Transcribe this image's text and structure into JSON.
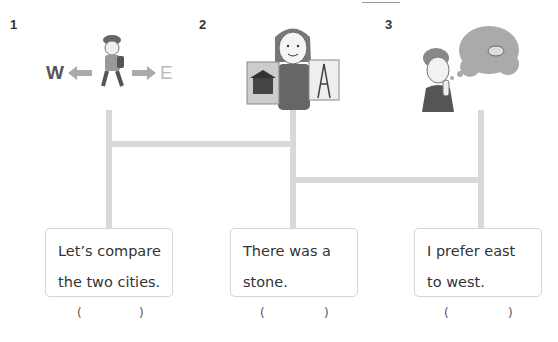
{
  "items": [
    {
      "number": "1",
      "illustration": "boy-walking-west-east-icon",
      "labels": {
        "west": "W",
        "east": "E"
      },
      "sentence_line1": "Let’s compare",
      "sentence_line2": "the two cities.",
      "answer_open": "(",
      "answer_close": ")"
    },
    {
      "number": "2",
      "illustration": "woman-holding-city-pictures-icon",
      "sentence_line1": "There was a",
      "sentence_line2": "stone.",
      "answer_open": "(",
      "answer_close": ")"
    },
    {
      "number": "3",
      "illustration": "boy-thinking-of-stone-icon",
      "sentence_line1": "I prefer east",
      "sentence_line2": "to west.",
      "answer_open": "(",
      "answer_close": ")"
    }
  ],
  "colors": {
    "line": "#d9d9d9",
    "card_border": "#d6d6d6",
    "text": "#333333"
  }
}
